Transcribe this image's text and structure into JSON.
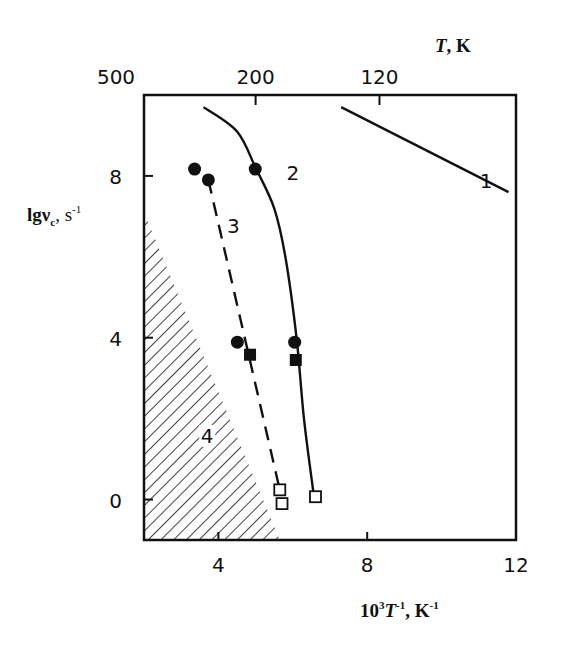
{
  "chart_data": {
    "type": "scatter",
    "title": "",
    "xlabel": "10^3·T^-1, K^-1",
    "ylabel": "lgν_c, s^-1",
    "top_axis_label": "T, K",
    "xlim": [
      2,
      12
    ],
    "ylim": [
      -1,
      10
    ],
    "grid": false,
    "x_ticks": [
      4,
      8,
      12
    ],
    "y_ticks": [
      0,
      4,
      8
    ],
    "top_ticks": [
      {
        "label": "500",
        "x": 2.0
      },
      {
        "label": "200",
        "x": 5.0
      },
      {
        "label": "120",
        "x": 8.33
      }
    ],
    "series": [
      {
        "name": "1",
        "kind": "line",
        "style": "solid",
        "points": [
          [
            7.3,
            9.7
          ],
          [
            11.8,
            7.6
          ]
        ]
      },
      {
        "name": "2",
        "kind": "line",
        "style": "solid",
        "points": [
          [
            3.6,
            9.7
          ],
          [
            4.5,
            9.1
          ],
          [
            5.0,
            8.2
          ],
          [
            5.5,
            7.2
          ],
          [
            5.8,
            6.0
          ],
          [
            6.1,
            4.0
          ],
          [
            6.3,
            2.0
          ],
          [
            6.55,
            0.2
          ]
        ]
      },
      {
        "name": "3",
        "kind": "line",
        "style": "dashed",
        "points": [
          [
            3.73,
            7.9
          ],
          [
            5.65,
            0.24
          ]
        ]
      },
      {
        "name": "filled circles",
        "kind": "marker",
        "marker": "filled-circle",
        "points": [
          [
            3.36,
            8.17
          ],
          [
            3.73,
            7.9
          ],
          [
            4.99,
            8.17
          ],
          [
            4.51,
            3.89
          ],
          [
            6.05,
            3.89
          ]
        ]
      },
      {
        "name": "filled squares",
        "kind": "marker",
        "marker": "filled-square",
        "points": [
          [
            4.85,
            3.58
          ],
          [
            6.08,
            3.45
          ]
        ]
      },
      {
        "name": "open squares",
        "kind": "marker",
        "marker": "open-square",
        "points": [
          [
            5.65,
            0.24
          ],
          [
            5.71,
            -0.1
          ],
          [
            6.61,
            0.07
          ]
        ]
      }
    ],
    "regions": [
      {
        "name": "4",
        "kind": "hatched",
        "polygon": [
          [
            2,
            7.1
          ],
          [
            2,
            -1
          ],
          [
            5.65,
            -1
          ]
        ]
      }
    ],
    "annotations": [
      {
        "text": "1",
        "x": 11.2,
        "y": 7.7
      },
      {
        "text": "2",
        "x": 6.0,
        "y": 7.9
      },
      {
        "text": "3",
        "x": 4.4,
        "y": 6.6
      },
      {
        "text": "4",
        "x": 3.7,
        "y": 1.4
      }
    ]
  },
  "labels": {
    "x_title_main": "10",
    "x_title_sup1": "3",
    "x_title_T": "T",
    "x_title_sup2": "-1",
    "x_title_unit": ", K",
    "x_title_sup3": "-1",
    "y_title_main": "lgν",
    "y_title_sub": "c",
    "y_title_unit": ", s",
    "y_title_sup": "-1",
    "top_title_T": "T",
    "top_title_unit": ", K"
  }
}
